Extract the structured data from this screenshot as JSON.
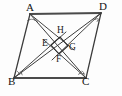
{
  "figure": {
    "background_color": "#fdfdfd",
    "line_color": "#3b3b3b",
    "side_color": "#4a4a4a",
    "label_color": "#141414",
    "vertices": {
      "A": {
        "label": "A",
        "x": 30,
        "y": 14
      },
      "B": {
        "label": "B",
        "x": 14,
        "y": 78
      },
      "C": {
        "label": "C",
        "x": 86,
        "y": 78
      },
      "D": {
        "label": "D",
        "x": 101,
        "y": 13
      }
    },
    "inner_points": {
      "E": {
        "label": "E",
        "x": 50,
        "y": 45
      },
      "F": {
        "label": "F",
        "x": 58,
        "y": 54
      },
      "G": {
        "label": "G",
        "x": 68,
        "y": 46
      },
      "H": {
        "label": "H",
        "x": 60,
        "y": 37
      }
    },
    "labels": {
      "A": "A",
      "B": "B",
      "C": "C",
      "D": "D",
      "E": "E",
      "F": "F",
      "G": "G",
      "H": "H"
    },
    "segments": [
      {
        "name": "side-AD",
        "from": "A",
        "to": "D",
        "style": "thick"
      },
      {
        "name": "side-BC",
        "from": "B",
        "to": "C",
        "style": "thick"
      },
      {
        "name": "side-AB",
        "from": "A",
        "to": "B",
        "style": "medium"
      },
      {
        "name": "side-DC",
        "from": "D",
        "to": "C",
        "style": "medium"
      },
      {
        "name": "diagonal-AC",
        "from": "A",
        "to": "C",
        "style": "thin"
      },
      {
        "name": "diagonal-BD",
        "from": "B",
        "to": "D",
        "style": "thin"
      },
      {
        "name": "bisector-A",
        "from": "A",
        "to": "G",
        "style": "bisector"
      },
      {
        "name": "bisector-B",
        "from": "B",
        "to": "H",
        "style": "bisector"
      },
      {
        "name": "bisector-C",
        "from": "C",
        "to": "E",
        "style": "bisector"
      },
      {
        "name": "bisector-D",
        "from": "D",
        "to": "F",
        "style": "bisector"
      }
    ],
    "inner_quadrilateral": {
      "name": "square-EHGF",
      "order": [
        "E",
        "H",
        "G",
        "F"
      ]
    },
    "angle_marks": [
      {
        "name": "angle-mark-A",
        "vertex": "A",
        "count": 2
      },
      {
        "name": "angle-mark-B",
        "vertex": "B",
        "count": 2
      },
      {
        "name": "angle-mark-C",
        "vertex": "C",
        "count": 2
      },
      {
        "name": "angle-mark-D",
        "vertex": "D",
        "count": 2
      }
    ]
  }
}
